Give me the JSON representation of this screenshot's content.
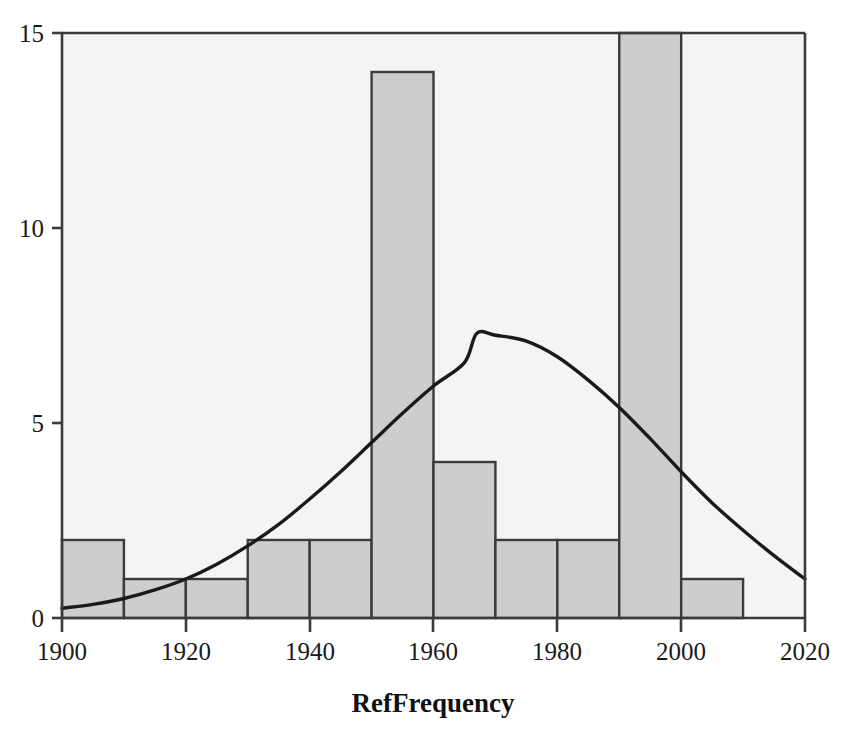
{
  "figure": {
    "background_color": "#ffffff",
    "plot_background_color": "#f4f4f4",
    "bar_fill_color": "#cdcdcd",
    "bar_edge_color": "#3b3b3b",
    "curve_color": "#1a1a1a",
    "axis_color": "#3b3b3b",
    "text_color": "#1a1a1a"
  },
  "axis_title": "RefFrequency",
  "y_tick_labels": [
    "0",
    "5",
    "10",
    "15"
  ],
  "x_tick_labels": [
    "1900",
    "1920",
    "1940",
    "1960",
    "1980",
    "2000",
    "2020"
  ],
  "chart_data": {
    "type": "bar",
    "title": "",
    "subtitle": "",
    "xlabel": "RefFrequency",
    "ylabel": "",
    "xlim": [
      1900,
      2020
    ],
    "ylim": [
      0,
      15
    ],
    "grid": false,
    "legend": "none",
    "bin_width": 10,
    "x_ticks": [
      1900,
      1920,
      1940,
      1960,
      1980,
      2000,
      2020
    ],
    "y_ticks": [
      0,
      5,
      10,
      15
    ],
    "categories": [
      "1900-1910",
      "1910-1920",
      "1920-1930",
      "1930-1940",
      "1940-1950",
      "1950-1960",
      "1960-1970",
      "1970-1980",
      "1980-1990",
      "1990-2000",
      "2000-2010",
      "2010-2020"
    ],
    "bin_edges": [
      1900,
      1910,
      1920,
      1930,
      1940,
      1950,
      1960,
      1970,
      1980,
      1990,
      2000,
      2010,
      2020
    ],
    "values": [
      2,
      1,
      1,
      2,
      2,
      14,
      4,
      2,
      2,
      16,
      1,
      0
    ],
    "series": [
      {
        "name": "Normal density overlay",
        "type": "line",
        "x": [
          1900,
          1905,
          1910,
          1915,
          1920,
          1925,
          1930,
          1935,
          1940,
          1945,
          1950,
          1955,
          1960,
          1965,
          1967,
          1970,
          1975,
          1980,
          1985,
          1990,
          1995,
          2000,
          2005,
          2010,
          2015,
          2020
        ],
        "values": [
          0.25,
          0.35,
          0.5,
          0.72,
          1.0,
          1.38,
          1.85,
          2.4,
          3.05,
          3.75,
          4.5,
          5.25,
          5.95,
          6.55,
          7.3,
          7.25,
          7.1,
          6.7,
          6.1,
          5.4,
          4.6,
          3.75,
          2.95,
          2.25,
          1.6,
          1.0
        ]
      }
    ]
  },
  "caption": {
    "partial_text": ""
  }
}
